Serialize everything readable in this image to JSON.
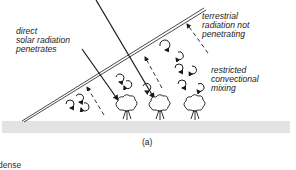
{
  "diagram": {
    "labels": {
      "solar_line1": "direct",
      "solar_line2": "solar radiation",
      "solar_line3": "penetrates",
      "terrestrial_line1": "terrestrial",
      "terrestrial_line2": "radiation not",
      "terrestrial_line3": "penetrating",
      "convection_line1": "restricted",
      "convection_line2": "convectional",
      "convection_line3": "mixing"
    },
    "caption": "(a)",
    "cutoff_text": "dense",
    "colors": {
      "ink": "#1a1a1a",
      "ground": "#e3e3e3"
    }
  }
}
